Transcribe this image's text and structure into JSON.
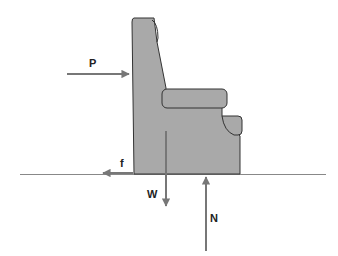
{
  "diagram": {
    "colors": {
      "chair_fill": "#a9a9a9",
      "chair_stroke": "#333333",
      "arrow": "#777777",
      "ground": "#888888",
      "background": "#ffffff"
    },
    "forces": [
      {
        "id": "P",
        "label": "P",
        "direction": "right",
        "description": "applied push"
      },
      {
        "id": "f",
        "label": "f",
        "direction": "left",
        "description": "friction"
      },
      {
        "id": "W",
        "label": "W",
        "direction": "down",
        "description": "weight"
      },
      {
        "id": "N",
        "label": "N",
        "direction": "up",
        "description": "normal force"
      }
    ]
  }
}
